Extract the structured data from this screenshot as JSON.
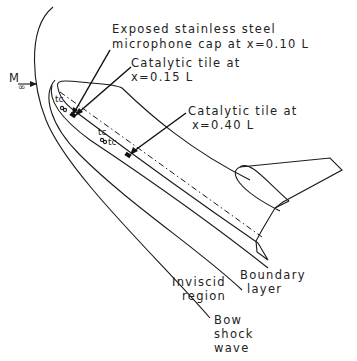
{
  "diagram": {
    "type": "annotated schematic",
    "freestream": {
      "label": "M",
      "subscript": "∞"
    },
    "callouts": [
      {
        "id": "mic-cap",
        "lines": [
          "Exposed stainless steel",
          "microphone cap at x=0.10 L"
        ]
      },
      {
        "id": "tile-015",
        "lines": [
          "Catalytic tile at",
          "x=0.15 L"
        ]
      },
      {
        "id": "tile-040",
        "lines": [
          "Catalytic tile at",
          "x=0.40 L"
        ]
      }
    ],
    "sensor_marks": [
      {
        "id": "tc-1",
        "label": "tc"
      },
      {
        "id": "tc-2",
        "label": "tc"
      },
      {
        "id": "tc-3",
        "label": "tc"
      }
    ],
    "regions": [
      {
        "id": "boundary-layer",
        "lines": [
          "Boundary",
          "layer"
        ]
      },
      {
        "id": "inviscid-region",
        "lines": [
          "Inviscid",
          "region"
        ]
      },
      {
        "id": "bow-shock",
        "lines": [
          "Bow",
          "shock",
          "wave"
        ]
      }
    ],
    "colors": {
      "line": "#1a1a1a",
      "background": "#ffffff"
    }
  }
}
